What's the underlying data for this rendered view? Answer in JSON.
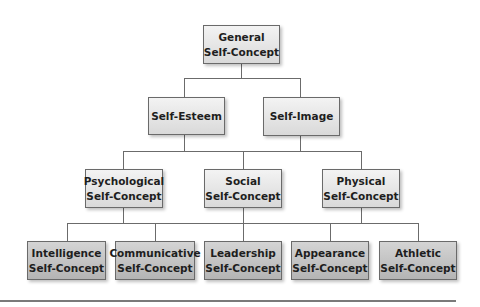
{
  "diagram": {
    "type": "hierarchy",
    "root": {
      "label_line1": "General",
      "label_line2": "Self-Concept"
    },
    "level2": [
      {
        "label": "Self-Esteem"
      },
      {
        "label": "Self-Image"
      }
    ],
    "level3": [
      {
        "label_line1": "Psychological",
        "label_line2": "Self-Concept"
      },
      {
        "label_line1": "Social",
        "label_line2": "Self-Concept"
      },
      {
        "label_line1": "Physical",
        "label_line2": "Self-Concept"
      }
    ],
    "level4": [
      {
        "label_line1": "Intelligence",
        "label_line2": "Self-Concept"
      },
      {
        "label_line1": "Communicative",
        "label_line2": "Self-Concept"
      },
      {
        "label_line1": "Leadership",
        "label_line2": "Self-Concept"
      },
      {
        "label_line1": "Appearance",
        "label_line2": "Self-Concept"
      },
      {
        "label_line1": "Athletic",
        "label_line2": "Self-Concept"
      }
    ],
    "edges": [
      [
        "General Self-Concept",
        "Self-Esteem"
      ],
      [
        "General Self-Concept",
        "Self-Image"
      ],
      [
        "Self-Esteem / Self-Image",
        "Psychological Self-Concept"
      ],
      [
        "Self-Esteem / Self-Image",
        "Social Self-Concept"
      ],
      [
        "Self-Esteem / Self-Image",
        "Physical Self-Concept"
      ],
      [
        "Psychological / Social / Physical",
        "Intelligence Self-Concept"
      ],
      [
        "Psychological / Social / Physical",
        "Communicative Self-Concept"
      ],
      [
        "Psychological / Social / Physical",
        "Leadership Self-Concept"
      ],
      [
        "Psychological / Social / Physical",
        "Appearance Self-Concept"
      ],
      [
        "Psychological / Social / Physical",
        "Athletic Self-Concept"
      ]
    ],
    "colors": {
      "box_light": "#e6e6e6",
      "box_dark": "#c4c4c4",
      "border": "#6a6a6a",
      "connector": "#6b6b6b",
      "text": "#1e1e1e"
    }
  }
}
